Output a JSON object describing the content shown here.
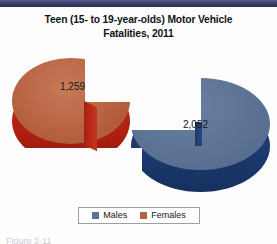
{
  "top_rule_color": "#3b3f6e",
  "title": {
    "line1": "Teen (15- to 19-year-olds) Motor Vehicle",
    "line2": "Fatalities, 2011"
  },
  "legend": {
    "items": [
      {
        "label": "Males",
        "color": "#5b7294"
      },
      {
        "label": "Females",
        "color": "#b5603f"
      }
    ]
  },
  "caption": "Figure 2-11",
  "chart_data": {
    "type": "pie",
    "title": "Teen (15- to 19-year-olds) Motor Vehicle Fatalities, 2011",
    "xlabel": "",
    "ylabel": "",
    "three_d": true,
    "exploded_slices": [
      "Females"
    ],
    "legend_position": "bottom",
    "grid": false,
    "total": 3311,
    "categories": [
      "Males",
      "Females"
    ],
    "values": [
      2052,
      1259
    ],
    "value_labels": [
      "2,052",
      "1,259"
    ],
    "percentages": [
      62.0,
      38.0
    ],
    "colors": [
      "#5b7294",
      "#b5603f"
    ],
    "side_colors": [
      "#1c3a6e",
      "#b02010"
    ],
    "series": [
      {
        "name": "Teen Motor Vehicle Fatalities, 2011",
        "values": [
          2052,
          1259
        ]
      }
    ]
  }
}
